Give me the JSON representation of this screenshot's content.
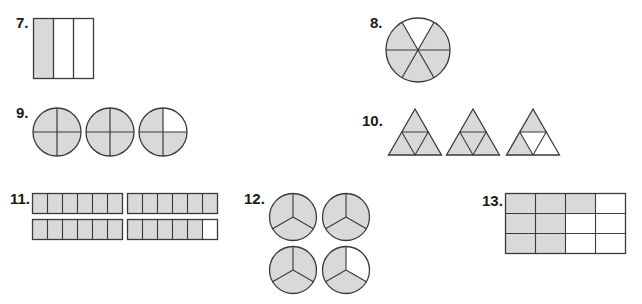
{
  "problems": [
    {
      "number": "7.",
      "shape": "rectangle split into 3 vertical parts",
      "parts": 3,
      "shaded": 1
    },
    {
      "number": "8.",
      "shape": "circle split into 6 sectors",
      "parts": 6,
      "shaded": 5
    },
    {
      "number": "9.",
      "shape": "3 circles split into quarters",
      "parts": 4,
      "wholes": 3,
      "shaded": 11
    },
    {
      "number": "10.",
      "shape": "3 triangles split into 4 small triangles",
      "parts": 4,
      "wholes": 3,
      "shaded": 10
    },
    {
      "number": "11.",
      "shape": "4 bars split into 6 parts",
      "parts": 6,
      "wholes": 4,
      "shaded": 23
    },
    {
      "number": "12.",
      "shape": "4 circles split into thirds",
      "parts": 3,
      "wholes": 4,
      "shaded": 11
    },
    {
      "number": "13.",
      "shape": "rectangle grid 4x3",
      "parts": 12,
      "shaded": 7
    }
  ],
  "colors": {
    "shade": "#d9d9d9",
    "stroke": "#3a3a3a",
    "empty": "#ffffff"
  }
}
